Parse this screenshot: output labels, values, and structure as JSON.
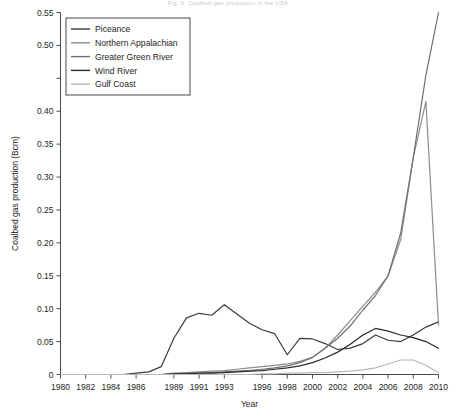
{
  "figure": {
    "cut_off_title": "Fig. 9. Coalbed gas production in the USA",
    "background": "#ffffff"
  },
  "chart_data": {
    "type": "line",
    "title": "",
    "xlabel": "Year",
    "ylabel": "Coalbed gas production (Bcm)",
    "xlim": [
      1980,
      2010
    ],
    "ylim": [
      0,
      0.55
    ],
    "grid": false,
    "legend_position": "top-left",
    "x_tick_labels": [
      "1980",
      "1982",
      "1984",
      "1986",
      "1989",
      "1991",
      "1993",
      "1996",
      "1998",
      "2000",
      "2002",
      "2004",
      "2006",
      "2008",
      "2010"
    ],
    "x_tick_values": [
      1980,
      1982,
      1984,
      1986,
      1989,
      1991,
      1993,
      1996,
      1998,
      2000,
      2002,
      2004,
      2006,
      2008,
      2010
    ],
    "y_tick_labels": [
      "0",
      "0.05",
      "0.10",
      "0.15",
      "0.20",
      "0.25",
      "0.30",
      "0.35",
      "0.40",
      "0.50",
      "0.55"
    ],
    "y_tick_values": [
      0,
      0.05,
      0.1,
      0.15,
      0.2,
      0.25,
      0.3,
      0.35,
      0.4,
      0.5,
      0.55
    ],
    "x": [
      1980,
      1981,
      1982,
      1983,
      1984,
      1985,
      1986,
      1987,
      1988,
      1989,
      1990,
      1991,
      1992,
      1993,
      1994,
      1995,
      1996,
      1997,
      1998,
      1999,
      2000,
      2001,
      2002,
      2003,
      2004,
      2005,
      2006,
      2007,
      2008,
      2009,
      2010
    ],
    "series": [
      {
        "name": "Piceance",
        "color": "#3b3b3b",
        "width": 1.2,
        "values": [
          0,
          0,
          0,
          0,
          0,
          0,
          0.002,
          0.004,
          0.012,
          0.055,
          0.086,
          0.093,
          0.09,
          0.106,
          0.092,
          0.078,
          0.068,
          0.062,
          0.03,
          0.055,
          0.054,
          0.047,
          0.038,
          0.04,
          0.047,
          0.06,
          0.052,
          0.05,
          0.06,
          0.072,
          0.08
        ]
      },
      {
        "name": "Northern Appalachian",
        "color": "#8d8d8d",
        "width": 1.2,
        "values": [
          0,
          0,
          0,
          0,
          0,
          0,
          0,
          0,
          0,
          0.002,
          0.003,
          0.004,
          0.005,
          0.006,
          0.008,
          0.01,
          0.012,
          0.014,
          0.016,
          0.02,
          0.026,
          0.04,
          0.06,
          0.082,
          0.104,
          0.125,
          0.15,
          0.205,
          0.33,
          0.415,
          0.075
        ]
      },
      {
        "name": "Greater Green River",
        "color": "#6e6e6e",
        "width": 1.2,
        "values": [
          0,
          0,
          0,
          0,
          0,
          0,
          0,
          0,
          0,
          0.001,
          0.002,
          0.002,
          0.003,
          0.004,
          0.005,
          0.006,
          0.008,
          0.01,
          0.013,
          0.018,
          0.026,
          0.04,
          0.055,
          0.074,
          0.098,
          0.12,
          0.15,
          0.215,
          0.33,
          0.455,
          0.55
        ]
      },
      {
        "name": "Wind River",
        "color": "#2b2b2b",
        "width": 1.2,
        "values": [
          0,
          0,
          0,
          0,
          0,
          0,
          0,
          0,
          0,
          0.001,
          0.001,
          0.002,
          0.002,
          0.003,
          0.004,
          0.005,
          0.006,
          0.008,
          0.01,
          0.013,
          0.018,
          0.025,
          0.034,
          0.046,
          0.06,
          0.07,
          0.066,
          0.06,
          0.056,
          0.05,
          0.04
        ]
      },
      {
        "name": "Gulf Coast",
        "color": "#b8b8b8",
        "width": 1.2,
        "values": [
          0,
          0,
          0,
          0,
          0,
          0,
          0,
          0,
          0,
          0,
          0,
          0,
          0,
          0,
          0,
          0,
          0.001,
          0.001,
          0.002,
          0.002,
          0.003,
          0.003,
          0.004,
          0.005,
          0.007,
          0.01,
          0.016,
          0.022,
          0.022,
          0.014,
          0.003
        ]
      }
    ]
  },
  "legend": {
    "entries": [
      {
        "label": "Piceance"
      },
      {
        "label": "Northern Appalachian"
      },
      {
        "label": "Greater Green River"
      },
      {
        "label": "Wind River"
      },
      {
        "label": "Gulf Coast"
      }
    ]
  }
}
